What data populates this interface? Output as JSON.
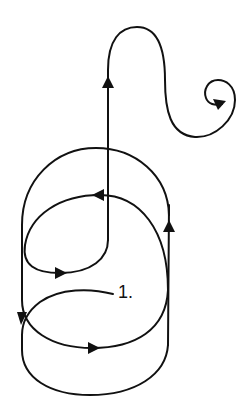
{
  "diagram": {
    "type": "trajectory-path",
    "stroke_color": "#111111",
    "background": "#ffffff",
    "start_label": "1.",
    "arrows": [
      {
        "position": "left-side-upper-loop",
        "direction": "down"
      },
      {
        "position": "middle-bottom-arc",
        "direction": "right"
      },
      {
        "position": "right-vertical",
        "direction": "up"
      },
      {
        "position": "inner-top-arc",
        "direction": "left"
      },
      {
        "position": "inner-bottom-arc",
        "direction": "right"
      },
      {
        "position": "central-vertical",
        "direction": "up"
      },
      {
        "position": "end-spiral",
        "direction": "inward"
      }
    ]
  }
}
